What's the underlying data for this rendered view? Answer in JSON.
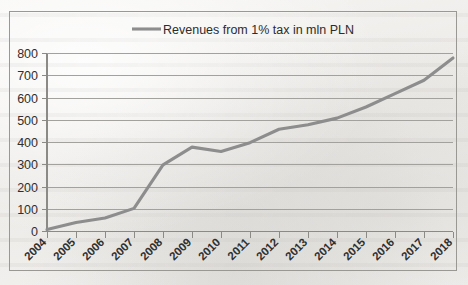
{
  "chart_data": {
    "type": "line",
    "title": "",
    "subtitle": "",
    "xlabel": "",
    "ylabel": "",
    "grid": true,
    "legend_position": "top-center",
    "categories": [
      "2004",
      "2005",
      "2006",
      "2007",
      "2008",
      "2009",
      "2010",
      "2011",
      "2012",
      "2013",
      "2014",
      "2015",
      "2016",
      "2017",
      "2018"
    ],
    "series": [
      {
        "name": "Revenues from 1% tax in mln PLN",
        "color": "#8d8d8d",
        "values": [
          10,
          42,
          62,
          105,
          300,
          380,
          360,
          400,
          460,
          480,
          510,
          560,
          620,
          680,
          780
        ]
      }
    ],
    "ylim": [
      0,
      800
    ],
    "yticks": [
      0,
      100,
      200,
      300,
      400,
      500,
      600,
      700,
      800
    ],
    "ytick_labels": [
      "0",
      "100",
      "200",
      "300",
      "400",
      "500",
      "600",
      "700",
      "800"
    ],
    "xtick_labels": [
      "2004",
      "2005",
      "2006",
      "2007",
      "2008",
      "2009",
      "2010",
      "2011",
      "2012",
      "2013",
      "2014",
      "2015",
      "2016",
      "2017",
      "2018"
    ]
  },
  "legend": {
    "entries": [
      {
        "label": "Revenues from 1% tax in mln PLN",
        "swatch": "line-swatch"
      }
    ]
  },
  "colors": {
    "series_line": "#8d8d8d",
    "gridline": "#a3a19d",
    "axis": "#8c8a86",
    "frame_border": "#9a9893",
    "tick_text": "#2f2f2f",
    "background": "#f2f1ef"
  }
}
